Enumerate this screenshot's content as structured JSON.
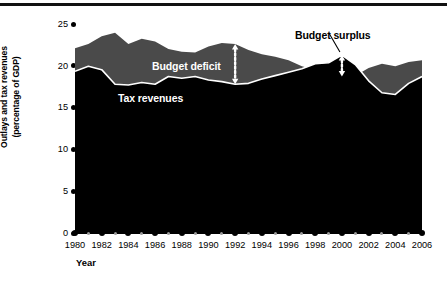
{
  "figure": {
    "background_color": "#ffffff",
    "rule_color": "#111111"
  },
  "axes": {
    "y_title_line1": "Outlays and tax revenues",
    "y_title_line2": "(percentage of GDP)",
    "x_title": "Year",
    "y_ticks": [
      "25",
      "20",
      "15",
      "10",
      "5",
      "0"
    ],
    "x_ticks": [
      "1980",
      "1982",
      "1984",
      "1986",
      "1988",
      "1990",
      "1992",
      "1994",
      "1996",
      "1998",
      "2000",
      "2002",
      "2004",
      "2006"
    ]
  },
  "labels": {
    "outlays": "Outlays",
    "deficit": "Budget deficit",
    "tax": "Tax revenues",
    "surplus": "Budget surplus"
  },
  "chart_data": {
    "type": "area",
    "title": "",
    "xlabel": "Year",
    "ylabel": "Outlays and tax revenues (percentage of GDP)",
    "xlim": [
      1980,
      2006
    ],
    "ylim": [
      0,
      25
    ],
    "grid": false,
    "legend": "in-plot labels",
    "x": [
      1980,
      1981,
      1982,
      1983,
      1984,
      1985,
      1986,
      1987,
      1988,
      1989,
      1990,
      1991,
      1992,
      1993,
      1994,
      1995,
      1996,
      1997,
      1998,
      1999,
      2000,
      2001,
      2002,
      2003,
      2004,
      2005,
      2006
    ],
    "series": [
      {
        "name": "Outlays",
        "color": "#4a4a4a",
        "values": [
          21.7,
          22.2,
          23.1,
          23.5,
          22.2,
          22.8,
          22.5,
          21.6,
          21.3,
          21.2,
          21.9,
          22.3,
          22.2,
          21.5,
          21.0,
          20.7,
          20.3,
          19.6,
          19.2,
          18.6,
          18.4,
          18.5,
          19.4,
          19.9,
          19.6,
          20.1,
          20.3
        ]
      },
      {
        "name": "Tax revenues",
        "color": "#000000",
        "values": [
          19.0,
          19.6,
          19.2,
          17.5,
          17.4,
          17.7,
          17.5,
          18.4,
          18.2,
          18.4,
          18.0,
          17.8,
          17.5,
          17.6,
          18.1,
          18.5,
          18.9,
          19.3,
          19.9,
          20.0,
          20.9,
          19.8,
          17.9,
          16.5,
          16.3,
          17.6,
          18.4
        ]
      }
    ],
    "annotations": [
      {
        "name": "budget-deficit",
        "text": "Budget deficit",
        "x": 1992,
        "kind": "double-headed-dotted-arrow",
        "from": 17.5,
        "to": 22.2
      },
      {
        "name": "budget-surplus",
        "text": "Budget surplus",
        "x": 2000,
        "kind": "double-headed-dotted-arrow-with-leader",
        "from": 18.4,
        "to": 20.9
      }
    ]
  }
}
